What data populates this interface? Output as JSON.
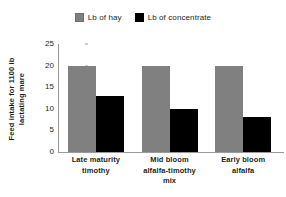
{
  "chart_data": {
    "type": "bar",
    "title": "",
    "subtitle": "",
    "xlabel": "",
    "ylabel": "Feed intake for 1100 lb lactating mare",
    "ylabel_lines": [
      "Feed intake for 1100 lb",
      "lactating mare"
    ],
    "categories": [
      "Late maturity timothy",
      "Mid bloom alfalfa-timothy mix",
      "Early bloom alfalfa"
    ],
    "category_lines": [
      [
        "Late maturity",
        "timothy"
      ],
      [
        "Mid bloom",
        "alfalfa-timothy",
        "mix"
      ],
      [
        "Early bloom",
        "alfalfa"
      ]
    ],
    "series": [
      {
        "name": "Lb of hay",
        "color": "#808080",
        "values": [
          20,
          20,
          20
        ]
      },
      {
        "name": "Lb of concentrate",
        "color": "#000000",
        "values": [
          13,
          10,
          8
        ]
      }
    ],
    "ylim": [
      0,
      25
    ],
    "yticks": [
      0,
      5,
      10,
      15,
      20,
      25
    ],
    "ytick_labels": [
      "0",
      "5",
      "10",
      "15",
      "20",
      "25"
    ],
    "grid": false,
    "legend_position": "top"
  },
  "legend": {
    "items": [
      {
        "label": "Lb of hay",
        "swatch": "gray-square-icon"
      },
      {
        "label": "Lb of concentrate",
        "swatch": "black-square-icon"
      }
    ]
  },
  "colors": {
    "hay": "#808080",
    "concentrate": "#000000",
    "axis": "#9a9a9a",
    "text": "#231f20",
    "background": "#ffffff"
  }
}
